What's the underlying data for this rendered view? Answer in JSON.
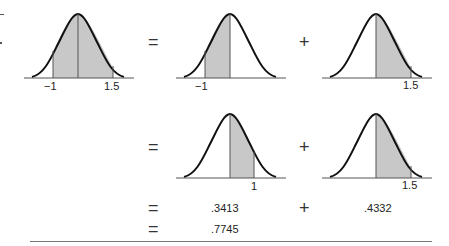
{
  "colors": {
    "curve": "#111111",
    "shade": "#c8c8c8",
    "axis": "#555555",
    "rule": "#777777"
  },
  "operators": {
    "equals": "=",
    "plus": "+"
  },
  "row1": {
    "curve_a": {
      "shade_from": -1,
      "shade_to": 1.5,
      "labels": [
        "−1",
        "1.5"
      ]
    },
    "curve_b": {
      "shade_from": -1,
      "shade_to": 0,
      "labels": [
        "−1"
      ]
    },
    "curve_c": {
      "shade_from": 0,
      "shade_to": 1.5,
      "labels": [
        "1.5"
      ]
    }
  },
  "row2": {
    "curve_a": {
      "shade_from": 0,
      "shade_to": 1,
      "labels": [
        "1"
      ]
    },
    "curve_b": {
      "shade_from": 0,
      "shade_to": 1.5,
      "labels": [
        "1.5"
      ]
    }
  },
  "row3": {
    "value_a": ".3413",
    "value_b": ".4332"
  },
  "row4": {
    "total": ".7745"
  }
}
